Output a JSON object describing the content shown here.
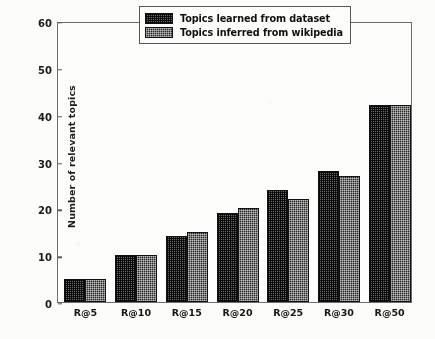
{
  "chart_data": {
    "type": "bar",
    "title": "",
    "xlabel": "",
    "ylabel": "Number of relevant topics",
    "categories": [
      "R@5",
      "R@10",
      "R@15",
      "R@20",
      "R@25",
      "R@30",
      "R@50"
    ],
    "series": [
      {
        "name": "Topics learned from dataset",
        "values": [
          5,
          10,
          14,
          19,
          24,
          28,
          42
        ],
        "color": "#6a6a6a",
        "pattern": "cross-hatch-light"
      },
      {
        "name": "Topics inferred from wikipedia",
        "values": [
          5,
          10,
          15,
          20,
          22,
          27,
          42
        ],
        "color": "#272727",
        "pattern": "cross-hatch-dark"
      }
    ],
    "ylim": [
      0,
      60
    ],
    "yticks": [
      0,
      10,
      20,
      30,
      40,
      50,
      60
    ],
    "ytick_labels": [
      "0",
      "10",
      "20",
      "30",
      "40",
      "50",
      "60"
    ],
    "grid": false,
    "legend_position": "upper-center-right",
    "legend_entries": [
      "Topics learned from dataset",
      "Topics inferred from wikipedia"
    ],
    "frame_color": "#6d6d6d",
    "background_color": "#fdfdfb"
  }
}
